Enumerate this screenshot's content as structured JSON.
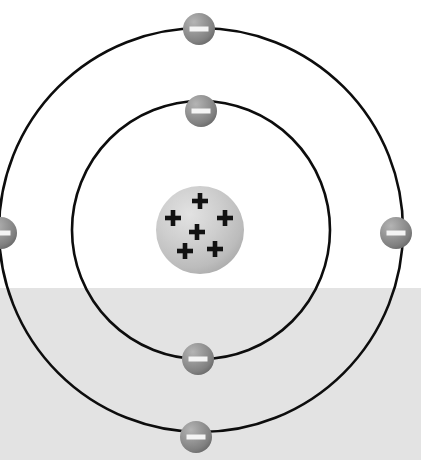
{
  "diagram": {
    "type": "bohr-atom-model",
    "element_symbol": "C",
    "proton_count": 6,
    "electron_count": 6,
    "shell_count": 2,
    "proton_glyph": "+",
    "electron_glyph": "–"
  },
  "canvas": {
    "width": 421,
    "height": 460,
    "background_color": "#ffffff",
    "floor_color": "#e3e3e3",
    "floor_top_y": 288
  },
  "nucleus": {
    "label": "nucleus",
    "center_x": 200,
    "center_y": 230,
    "radius": 44,
    "fill_light": "#d9d9d9",
    "fill_mid": "#c4c4c4",
    "fill_dark": "#a8a8a8",
    "protons": [
      {
        "label": "proton",
        "charge": "+",
        "x": 200,
        "y": 201
      },
      {
        "label": "proton",
        "charge": "+",
        "x": 173,
        "y": 218
      },
      {
        "label": "proton",
        "charge": "+",
        "x": 225,
        "y": 218
      },
      {
        "label": "proton",
        "charge": "+",
        "x": 197,
        "y": 232
      },
      {
        "label": "proton",
        "charge": "+",
        "x": 185,
        "y": 251
      },
      {
        "label": "proton",
        "charge": "+",
        "x": 215,
        "y": 249
      }
    ]
  },
  "shells": [
    {
      "name": "inner-shell",
      "shell_number": 1,
      "center_x": 201,
      "center_y": 230,
      "radius": 129,
      "stroke_color": "#0d0d0d",
      "stroke_width": 2.6,
      "electron_count": 2,
      "electrons": [
        {
          "label": "electron",
          "charge": "–",
          "x": 201,
          "y": 111
        },
        {
          "label": "electron",
          "charge": "–",
          "x": 198,
          "y": 359
        }
      ]
    },
    {
      "name": "outer-shell",
      "shell_number": 2,
      "center_x": 201,
      "center_y": 230,
      "radius": 202,
      "stroke_color": "#0d0d0d",
      "stroke_width": 2.6,
      "electron_count": 4,
      "electrons": [
        {
          "label": "electron",
          "charge": "–",
          "x": 199,
          "y": 29
        },
        {
          "label": "electron",
          "charge": "–",
          "x": 396,
          "y": 233
        },
        {
          "label": "electron",
          "charge": "–",
          "x": 1,
          "y": 233
        },
        {
          "label": "electron",
          "charge": "–",
          "x": 196,
          "y": 437
        }
      ]
    }
  ],
  "electron_style": {
    "radius": 16,
    "fill_light": "#a9a9a9",
    "fill_mid": "#8e8e8e",
    "fill_dark": "#6e6e6e",
    "minus_color": "#f4f4f4",
    "minus_width": 19,
    "minus_height": 5
  }
}
